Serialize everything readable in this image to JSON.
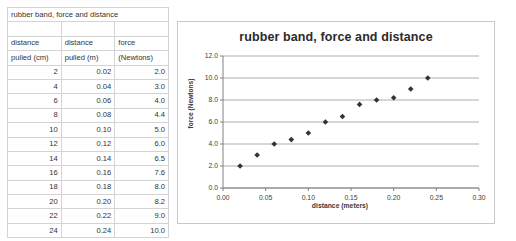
{
  "table": {
    "title": "rubber band, force and distance",
    "headers": [
      [
        "distance",
        "distance",
        "force"
      ],
      [
        "pulled (cm)",
        "pulled (m)",
        "(Newtons)"
      ]
    ],
    "rows": [
      [
        "2",
        "0.02",
        "2.0"
      ],
      [
        "4",
        "0.04",
        "3.0"
      ],
      [
        "6",
        "0.06",
        "4.0"
      ],
      [
        "8",
        "0.08",
        "4.4"
      ],
      [
        "10",
        "0.10",
        "5.0"
      ],
      [
        "12",
        "0.12",
        "6.0"
      ],
      [
        "14",
        "0.14",
        "6.5"
      ],
      [
        "16",
        "0.16",
        "7.6"
      ],
      [
        "18",
        "0.18",
        "8.0"
      ],
      [
        "20",
        "0.20",
        "8.2"
      ],
      [
        "22",
        "0.22",
        "9.0"
      ],
      [
        "24",
        "0.24",
        "10.0"
      ]
    ]
  },
  "chart_data": {
    "type": "scatter",
    "title": "rubber band, force and distance",
    "xlabel": "distance (meters)",
    "ylabel": "force (Newtons)",
    "xlim": [
      0.0,
      0.3
    ],
    "ylim": [
      0.0,
      12.0
    ],
    "xticks": [
      "0.00",
      "0.05",
      "0.10",
      "0.15",
      "0.20",
      "0.25",
      "0.30"
    ],
    "xtick_values": [
      0.0,
      0.05,
      0.1,
      0.15,
      0.2,
      0.25,
      0.3
    ],
    "yticks": [
      "0.0",
      "2.0",
      "4.0",
      "6.0",
      "8.0",
      "10.0",
      "12.0"
    ],
    "ytick_values": [
      0.0,
      2.0,
      4.0,
      6.0,
      8.0,
      10.0,
      12.0
    ],
    "grid": "horizontal",
    "legend": "none",
    "marker": "diamond",
    "marker_color": "#333333",
    "x": [
      0.02,
      0.04,
      0.06,
      0.08,
      0.1,
      0.12,
      0.14,
      0.16,
      0.18,
      0.2,
      0.22,
      0.24
    ],
    "y": [
      2.0,
      3.0,
      4.0,
      4.4,
      5.0,
      6.0,
      6.5,
      7.6,
      8.0,
      8.2,
      9.0,
      10.0
    ]
  },
  "colors": {
    "grid": "#999999",
    "axis": "#808080",
    "border": "#c8c8c8",
    "marker": "#333333",
    "table_border": "#d4d4d4",
    "text": "#333333"
  }
}
